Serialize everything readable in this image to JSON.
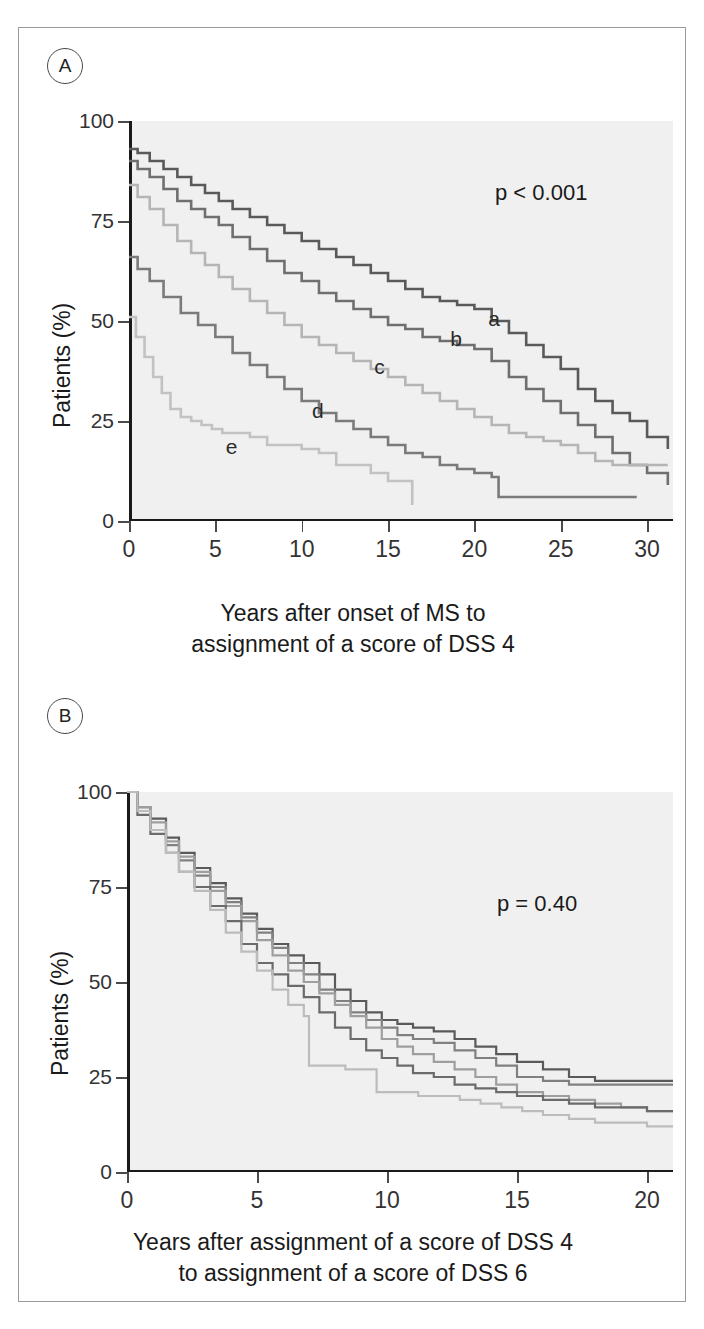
{
  "figure": {
    "panels": [
      {
        "id": "A",
        "badge": "A",
        "pvalue": "p < 0.001",
        "ylabel": "Patients (%)",
        "xcaption_line1": "Years after onset of MS to",
        "xcaption_line2": "assignment of a score of DSS 4",
        "yticks": [
          "0",
          "25",
          "50",
          "75",
          "100"
        ],
        "xticks": [
          "0",
          "5",
          "10",
          "15",
          "20",
          "25",
          "30"
        ],
        "curve_labels": [
          "a",
          "b",
          "c",
          "d",
          "e"
        ]
      },
      {
        "id": "B",
        "badge": "B",
        "pvalue": "p = 0.40",
        "ylabel": "Patients (%)",
        "xcaption_line1": "Years after assignment of a score of DSS 4",
        "xcaption_line2": "to assignment of a score of DSS 6",
        "yticks": [
          "0",
          "25",
          "50",
          "75",
          "100"
        ],
        "xticks": [
          "0",
          "5",
          "10",
          "15",
          "20"
        ],
        "curve_labels": []
      }
    ]
  },
  "chart_data": [
    {
      "type": "line",
      "subplot": "A",
      "title": "",
      "xlabel": "Years after onset of MS to assignment of a score of DSS 4",
      "ylabel": "Patients (%)",
      "xlim": [
        0,
        31.5
      ],
      "ylim": [
        0,
        100
      ],
      "xticks": [
        0,
        5,
        10,
        15,
        20,
        25,
        30
      ],
      "yticks": [
        0,
        25,
        50,
        75,
        100
      ],
      "grid": false,
      "legend": "inline-labels",
      "annotations": [
        "p < 0.001"
      ],
      "series": [
        {
          "name": "a",
          "label_xy": [
            20.8,
            50
          ],
          "color": "#5a5a5a",
          "x": [
            0,
            0.5,
            1.2,
            2.0,
            2.8,
            3.6,
            4.4,
            5.2,
            6.0,
            7.0,
            8.0,
            9.0,
            10.0,
            11.0,
            12.0,
            13.0,
            14.0,
            15.0,
            16.0,
            17.0,
            18.0,
            19.0,
            20.0,
            21.0,
            22.0,
            23.0,
            24.0,
            25.0,
            26.0,
            27.0,
            28.0,
            29.0,
            30.0,
            31.2
          ],
          "y": [
            93,
            92,
            90,
            88,
            86,
            84,
            82,
            80,
            78,
            76,
            74,
            72,
            70,
            68,
            66,
            64,
            62,
            60,
            58,
            56,
            55,
            54,
            53,
            50,
            47,
            44,
            41,
            38,
            33,
            30,
            27,
            25,
            21,
            18
          ]
        },
        {
          "name": "b",
          "label_xy": [
            18.6,
            45
          ],
          "color": "#6f6f6f",
          "x": [
            0,
            0.5,
            1.2,
            2.0,
            2.8,
            3.6,
            4.4,
            5.2,
            6.0,
            7.0,
            8.0,
            9.0,
            10.0,
            11.0,
            12.0,
            13.0,
            14.0,
            15.0,
            16.0,
            17.0,
            18.0,
            19.0,
            20.0,
            21.0,
            22.0,
            23.0,
            24.0,
            25.0,
            26.0,
            27.0,
            28.0,
            29.0,
            30.0,
            31.2
          ],
          "y": [
            90,
            88,
            86,
            83,
            80,
            78,
            76,
            74,
            71,
            68,
            65,
            62,
            60,
            57,
            55,
            53,
            51,
            49,
            48,
            46,
            45,
            44,
            43,
            40,
            36,
            33,
            30,
            27,
            24,
            21,
            17,
            14,
            12,
            9
          ]
        },
        {
          "name": "c",
          "label_xy": [
            14.2,
            38
          ],
          "color": "#b5b5b5",
          "x": [
            0,
            0.5,
            1.2,
            2.0,
            2.8,
            3.6,
            4.4,
            5.2,
            6.0,
            7.0,
            8.0,
            9.0,
            10.0,
            11.0,
            12.0,
            13.0,
            14.0,
            15.0,
            16.0,
            17.0,
            18.0,
            19.0,
            20.0,
            21.0,
            22.0,
            23.0,
            24.0,
            25.0,
            26.0,
            27.0,
            28.0,
            29.5,
            31.2
          ],
          "y": [
            84,
            81,
            78,
            74,
            70,
            67,
            64,
            61,
            58,
            55,
            52,
            49,
            46,
            44,
            42,
            40,
            38,
            36,
            34,
            32,
            30,
            28,
            26,
            24,
            22,
            21,
            20,
            19,
            17,
            15,
            14,
            14,
            14
          ]
        },
        {
          "name": "d",
          "label_xy": [
            10.6,
            27
          ],
          "color": "#7a7a7a",
          "x": [
            0,
            0.5,
            1.2,
            2.0,
            3.0,
            4.0,
            5.0,
            6.0,
            7.0,
            8.0,
            9.0,
            10.0,
            11.0,
            12.0,
            13.0,
            14.0,
            15.0,
            16.0,
            17.0,
            18.0,
            19.0,
            20.0,
            21.0,
            21.4,
            29.4
          ],
          "y": [
            66,
            63,
            60,
            56,
            52,
            49,
            46,
            42,
            39,
            36,
            33,
            30,
            27,
            25,
            23,
            21,
            19,
            17,
            16,
            14,
            13,
            12,
            11,
            6,
            6
          ]
        },
        {
          "name": "e",
          "label_xy": [
            5.6,
            18
          ],
          "color": "#c2c2c2",
          "x": [
            0,
            0.4,
            0.9,
            1.4,
            1.9,
            2.4,
            3.0,
            3.6,
            4.2,
            4.8,
            5.4,
            6.0,
            7.0,
            8.0,
            9.0,
            10.0,
            11.0,
            12.0,
            13.0,
            14.0,
            15.0,
            16.0,
            16.4
          ],
          "y": [
            51,
            46,
            41,
            36,
            32,
            28,
            26,
            25,
            24,
            23,
            22,
            22,
            21,
            19,
            19,
            18,
            17,
            14,
            14,
            12,
            10,
            10,
            4
          ]
        }
      ]
    },
    {
      "type": "line",
      "subplot": "B",
      "title": "",
      "xlabel": "Years after assignment of a score of DSS 4 to assignment of a score of DSS 6",
      "ylabel": "Patients (%)",
      "xlim": [
        0,
        21
      ],
      "ylim": [
        0,
        100
      ],
      "xticks": [
        0,
        5,
        10,
        15,
        20
      ],
      "yticks": [
        0,
        25,
        50,
        75,
        100
      ],
      "grid": false,
      "legend": "none",
      "annotations": [
        "p = 0.40"
      ],
      "series": [
        {
          "name": "a",
          "color": "#5a5a5a",
          "x": [
            0,
            0.4,
            0.9,
            1.5,
            2.0,
            2.6,
            3.2,
            3.8,
            4.4,
            5.0,
            5.6,
            6.2,
            6.8,
            7.4,
            8.0,
            8.6,
            9.2,
            9.8,
            10.4,
            11.0,
            11.8,
            12.6,
            13.4,
            14.2,
            15.0,
            16.0,
            17.0,
            18.0,
            19.0,
            20.0,
            21.0
          ],
          "y": [
            100,
            96,
            93,
            88,
            84,
            80,
            76,
            72,
            68,
            64,
            60,
            57,
            55,
            52,
            48,
            45,
            42,
            40,
            39,
            38,
            37,
            35,
            33,
            31,
            29,
            27,
            25,
            24,
            24,
            24,
            24
          ]
        },
        {
          "name": "b",
          "color": "#808080",
          "x": [
            0,
            0.4,
            0.9,
            1.5,
            2.0,
            2.6,
            3.2,
            3.8,
            4.4,
            5.0,
            5.6,
            6.2,
            6.8,
            7.4,
            8.0,
            8.6,
            9.2,
            9.8,
            10.4,
            11.0,
            11.8,
            12.6,
            13.4,
            14.2,
            15.0,
            16.0,
            17.0,
            18.0,
            19.0,
            20.0,
            21.0
          ],
          "y": [
            100,
            95,
            90,
            86,
            82,
            78,
            75,
            71,
            67,
            63,
            59,
            55,
            52,
            48,
            45,
            42,
            40,
            38,
            36,
            35,
            34,
            32,
            30,
            28,
            25,
            24,
            23,
            23,
            23,
            23,
            23
          ]
        },
        {
          "name": "c",
          "color": "#9e9e9e",
          "x": [
            0,
            0.4,
            0.9,
            1.5,
            2.0,
            2.6,
            3.2,
            3.8,
            4.4,
            5.0,
            5.6,
            6.2,
            6.8,
            7.4,
            8.0,
            8.6,
            9.2,
            9.8,
            10.4,
            11.0,
            11.8,
            12.6,
            13.4,
            14.2,
            15.0,
            16.0,
            17.0,
            18.0,
            19.0,
            20.0,
            21.0
          ],
          "y": [
            100,
            96,
            92,
            87,
            83,
            79,
            74,
            70,
            66,
            61,
            57,
            53,
            50,
            47,
            44,
            41,
            38,
            35,
            33,
            31,
            29,
            27,
            25,
            23,
            21,
            20,
            19,
            18,
            17,
            16,
            16
          ]
        },
        {
          "name": "d",
          "color": "#6b6b6b",
          "x": [
            0,
            0.4,
            0.9,
            1.5,
            2.0,
            2.6,
            3.2,
            3.8,
            4.4,
            5.0,
            5.6,
            6.2,
            6.8,
            7.4,
            8.0,
            8.6,
            9.2,
            9.8,
            10.4,
            11.0,
            11.8,
            12.6,
            13.4,
            14.2,
            15.0,
            16.0,
            17.0,
            18.0,
            19.0,
            20.0,
            21.0
          ],
          "y": [
            100,
            94,
            89,
            84,
            79,
            75,
            70,
            66,
            60,
            55,
            52,
            49,
            46,
            42,
            38,
            35,
            32,
            30,
            28,
            26,
            25,
            23,
            22,
            21,
            20,
            19,
            18,
            17,
            17,
            16,
            16
          ]
        },
        {
          "name": "e",
          "color": "#bcbcbc",
          "x": [
            0,
            0.4,
            0.9,
            1.5,
            2.0,
            2.6,
            3.2,
            3.8,
            4.4,
            5.0,
            5.6,
            6.2,
            6.8,
            7.0,
            7.6,
            8.4,
            9.2,
            9.6,
            10.4,
            11.2,
            12.0,
            12.8,
            13.6,
            14.4,
            15.2,
            16.0,
            17.0,
            18.0,
            19.0,
            20.0,
            21.0
          ],
          "y": [
            100,
            95,
            90,
            84,
            79,
            74,
            69,
            63,
            58,
            53,
            48,
            44,
            41,
            28,
            28,
            27,
            27,
            21,
            21,
            20,
            20,
            19,
            18,
            17,
            16,
            15,
            14,
            13,
            13,
            12,
            12
          ]
        }
      ]
    }
  ]
}
